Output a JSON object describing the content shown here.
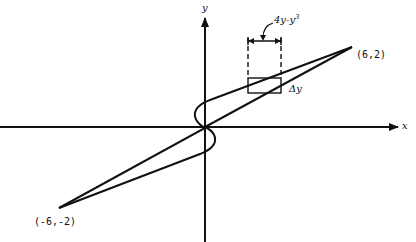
{
  "diagram": {
    "axes": {
      "x_label": "x",
      "y_label": "y"
    },
    "points": {
      "upper_right": "(6,2)",
      "lower_left": "(-6,-2)"
    },
    "annotations": {
      "width_label": "4y-y",
      "width_exponent": "3",
      "height_label": "Δy"
    },
    "colors": {
      "stroke": "#111111",
      "background": "#ffffff"
    }
  }
}
